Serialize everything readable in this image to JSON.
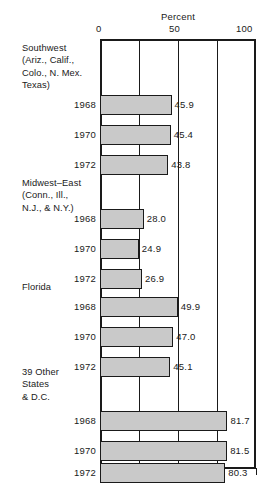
{
  "chart_data": {
    "type": "bar",
    "orientation": "horizontal",
    "title": "",
    "xlabel": "Percent",
    "ylabel": "",
    "xlim": [
      0,
      100
    ],
    "xticks": [
      0,
      25,
      50,
      75,
      100
    ],
    "xtick_labels": [
      "0",
      "",
      "50",
      "",
      "100"
    ],
    "grid": true,
    "grid_axis": "x",
    "legend": "none",
    "bar_color": "#c9c9c9",
    "bar_edge_color": "#1a1a1a",
    "categories": [
      "1968",
      "1970",
      "1972"
    ],
    "groups": [
      {
        "label": "Southwest\n(Ariz., Calif.,\nColo., N. Mex.\nTexas)",
        "label_lines": [
          "Southwest",
          "(Ariz., Calif.,",
          "Colo., N. Mex.",
          "Texas)"
        ],
        "rows": [
          {
            "year": "1968",
            "value": 45.9,
            "value_label": "45.9"
          },
          {
            "year": "1970",
            "value": 45.4,
            "value_label": "45.4"
          },
          {
            "year": "1972",
            "value": 43.8,
            "value_label": "43.8"
          }
        ]
      },
      {
        "label": "Midwest-East\n(Conn., Ill.,\nN.J., & N.Y.)",
        "label_lines": [
          "Midwest–East",
          "(Conn., Ill.,",
          "N.J., & N.Y.)"
        ],
        "rows": [
          {
            "year": "1968",
            "value": 28.0,
            "value_label": "28.0"
          },
          {
            "year": "1970",
            "value": 24.9,
            "value_label": "24.9"
          },
          {
            "year": "1972",
            "value": 26.9,
            "value_label": "26.9"
          }
        ]
      },
      {
        "label": "Florida",
        "label_lines": [
          "Florida"
        ],
        "rows": [
          {
            "year": "1968",
            "value": 49.9,
            "value_label": "49.9"
          },
          {
            "year": "1970",
            "value": 47.0,
            "value_label": "47.0"
          },
          {
            "year": "1972",
            "value": 45.1,
            "value_label": "45.1"
          }
        ]
      },
      {
        "label": "39 Other\nStates\n& D.C.",
        "label_lines": [
          "39 Other",
          "States",
          "& D.C."
        ],
        "rows": [
          {
            "year": "1968",
            "value": 81.7,
            "value_label": "81.7"
          },
          {
            "year": "1970",
            "value": 81.5,
            "value_label": "81.5"
          },
          {
            "year": "1972",
            "value": 80.3,
            "value_label": "80.3"
          }
        ]
      }
    ]
  },
  "axis": {
    "title": "Percent",
    "ticks": [
      {
        "value": 0,
        "label": "0"
      },
      {
        "value": 25,
        "label": ""
      },
      {
        "value": 50,
        "label": "50"
      },
      {
        "value": 75,
        "label": ""
      },
      {
        "value": 100,
        "label": "100"
      }
    ]
  }
}
